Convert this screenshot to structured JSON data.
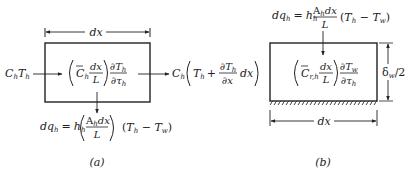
{
  "diagram": {
    "panel_a": {
      "label": "(a)",
      "dim_top": "dx",
      "inlet": {
        "C": "C",
        "sub_h": "h",
        "T": "T",
        "sub_h2": "h"
      },
      "storage_term": {
        "C": "C",
        "sub_h": "h",
        "frac_num": "dx",
        "frac_den": "L",
        "dnum": "∂T",
        "dnum_sub": "h",
        "dden": "∂τ",
        "dden_sub": "h"
      },
      "outlet": {
        "C": "C",
        "sub_h": "h",
        "T": "T",
        "sub_T": "h",
        "plus": "+",
        "dnum": "∂T",
        "dnum_sub": "h",
        "dden": "∂x",
        "tail": "dx"
      },
      "heat_flux": {
        "lhs": "dq",
        "lhs_sub": "h",
        "eq": "=",
        "h": "h",
        "h_sub": "h",
        "frac_num": "A",
        "frac_num_sub": "h",
        "frac_num_tail": "dx",
        "frac_den": "L",
        "paren": "(T",
        "T_sub": "h",
        "minus": " − T",
        "Tw_sub": "w",
        "close": ")"
      }
    },
    "panel_b": {
      "label": "(b)",
      "dim_bottom": "dx",
      "dim_side": "δ",
      "dim_side_sub": "w",
      "dim_side_tail": "/2",
      "heat_flux": {
        "lhs": "dq",
        "lhs_sub": "h",
        "eq": "=",
        "h": "h",
        "h_sub": "h",
        "frac_num": "A",
        "frac_num_sub": "h",
        "frac_num_tail": "dx",
        "frac_den": "L",
        "paren": "(T",
        "T_sub": "h",
        "minus": " − T",
        "Tw_sub": "w",
        "close": ")"
      },
      "storage_term": {
        "C": "C",
        "sub": "r,h",
        "frac_num": "dx",
        "frac_den": "L",
        "dnum": "∂T",
        "dnum_sub": "w",
        "dden": "∂τ",
        "dden_sub": "h"
      }
    },
    "colors": {
      "ink": "#222222",
      "background": "#ffffff"
    }
  }
}
